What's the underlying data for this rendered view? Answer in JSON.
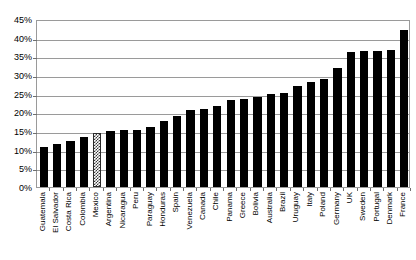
{
  "chart_data": {
    "type": "bar",
    "title": "",
    "subtitle": "",
    "xlabel": "",
    "ylabel": "",
    "ylim": [
      0,
      45
    ],
    "grid": true,
    "legend": "none",
    "y_ticks": [
      "0%",
      "5%",
      "10%",
      "15%",
      "20%",
      "25%",
      "30%",
      "35%",
      "40%",
      "45%"
    ],
    "y_tick_values": [
      0,
      5,
      10,
      15,
      20,
      25,
      30,
      35,
      40,
      45
    ],
    "categories": [
      "Guatemala",
      "El Salvador",
      "Costa Rica",
      "Colombia",
      "Mexico",
      "Argentina",
      "Nicaragua",
      "Peru",
      "Paraguay",
      "Honduras",
      "Spain",
      "Venezuela",
      "Canada",
      "Chile",
      "Panama",
      "Greece",
      "Bolivia",
      "Australia",
      "Brazil",
      "Uruguay",
      "Italy",
      "Poland",
      "Germany",
      "UK",
      "Sweden",
      "Portugal",
      "Denmark",
      "France"
    ],
    "values": [
      10.7,
      11.5,
      12.3,
      13.5,
      14.5,
      15.0,
      15.2,
      15.4,
      16.0,
      17.7,
      19.0,
      20.5,
      21.0,
      21.8,
      23.2,
      23.6,
      24.0,
      24.8,
      25.2,
      27.0,
      28.2,
      29.0,
      31.8,
      36.2,
      36.3,
      36.4,
      36.8,
      42.0
    ],
    "highlight_category": "Mexico",
    "highlight_index": 4,
    "bar_color": "#000000",
    "highlight_pattern": "checkerboard",
    "grid_color": "#9a9a9a",
    "background_color": "#ffffff"
  }
}
